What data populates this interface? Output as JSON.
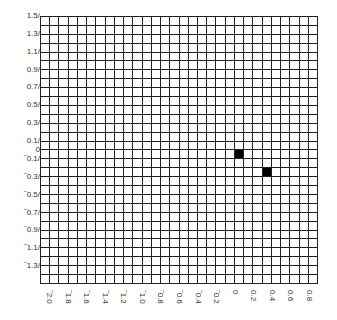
{
  "chart_data": {
    "type": "heatmap",
    "title": "",
    "xlabel": "",
    "ylabel": "",
    "grid": true,
    "grid_size": {
      "cols": 30,
      "rows": 30
    },
    "cell_step": 0.1,
    "xlim": [
      -2.1,
      0.9
    ],
    "ylim": [
      -1.5,
      1.5
    ],
    "x_ticks": [
      {
        "label": "‾2.0",
        "value": -2.0
      },
      {
        "label": "‾1.8",
        "value": -1.8
      },
      {
        "label": "‾1.6",
        "value": -1.6
      },
      {
        "label": "‾1.4",
        "value": -1.4
      },
      {
        "label": "‾1.2",
        "value": -1.2
      },
      {
        "label": "‾1.0",
        "value": -1.0
      },
      {
        "label": "‾0.8",
        "value": -0.8
      },
      {
        "label": "‾0.6",
        "value": -0.6
      },
      {
        "label": "‾0.4",
        "value": -0.4
      },
      {
        "label": "‾0.2",
        "value": -0.2
      },
      {
        "label": "0",
        "value": 0
      },
      {
        "label": "0.2",
        "value": 0.2
      },
      {
        "label": "0.4",
        "value": 0.4
      },
      {
        "label": "0.6",
        "value": 0.6
      },
      {
        "label": "0.8",
        "value": 0.8
      }
    ],
    "y_ticks": [
      {
        "label": "1.5/",
        "value": 1.5
      },
      {
        "label": "1.3/",
        "value": 1.3
      },
      {
        "label": "1.1/",
        "value": 1.1
      },
      {
        "label": "0.9/",
        "value": 0.9
      },
      {
        "label": "0.7/",
        "value": 0.7
      },
      {
        "label": "0.5/",
        "value": 0.5
      },
      {
        "label": "0.3/",
        "value": 0.3
      },
      {
        "label": "0.1/",
        "value": 0.1
      },
      {
        "label": "0",
        "value": 0
      },
      {
        "label": "‾0.1/",
        "value": -0.1
      },
      {
        "label": "‾0.3/",
        "value": -0.3
      },
      {
        "label": "‾0.5/",
        "value": -0.5
      },
      {
        "label": "‾0.7/",
        "value": -0.7
      },
      {
        "label": "‾0.9/",
        "value": -0.9
      },
      {
        "label": "‾1.1/",
        "value": -1.1
      },
      {
        "label": "‾1.3/",
        "value": -1.3
      }
    ],
    "filled_cells": [
      {
        "x": 0.0,
        "y": 0.0,
        "col": 21,
        "row": 15,
        "color": "#000000"
      },
      {
        "x": 0.3,
        "y": -0.2,
        "col": 24,
        "row": 17,
        "color": "#000000"
      }
    ],
    "colors": {
      "grid_line": "#222222",
      "filled": "#000000",
      "empty": "#ffffff"
    }
  }
}
